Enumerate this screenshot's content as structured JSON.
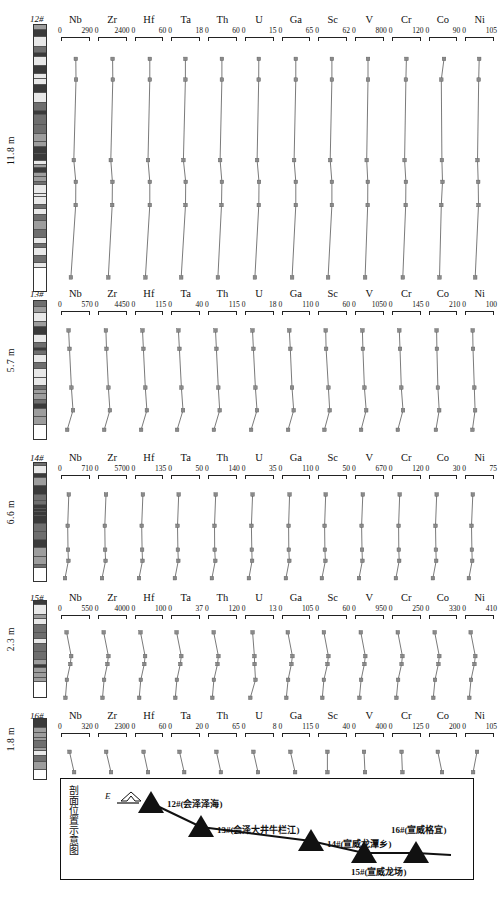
{
  "figure": {
    "elements": [
      "Nb",
      "Zr",
      "Hf",
      "Ta",
      "Th",
      "U",
      "Ga",
      "Sc",
      "V",
      "Cr",
      "Co",
      "Ni"
    ],
    "marker_color": "#8a8a8a",
    "line_color": "#6b6b6b"
  },
  "chart_data": {
    "type": "line",
    "xlabel": "Element concentration (ppm)",
    "ylabel": "Stratigraphic thickness (m)",
    "grid": false,
    "legend": "none",
    "orientation": "vertical-depth",
    "elements": [
      "Nb",
      "Zr",
      "Hf",
      "Ta",
      "Th",
      "U",
      "Ga",
      "Sc",
      "V",
      "Cr",
      "Co",
      "Ni"
    ],
    "panels": [
      {
        "section_id": "12",
        "section_label": "12#",
        "thickness_m": "11.8 m",
        "n_samples": 7,
        "depth_fraction": [
          0.03,
          0.12,
          0.47,
          0.565,
          0.665,
          0.98
        ],
        "axis_ranges": {
          "Nb": [
            0,
            290
          ],
          "Zr": [
            0,
            2400
          ],
          "Hf": [
            0,
            60
          ],
          "Ta": [
            0,
            18
          ],
          "Th": [
            0,
            60
          ],
          "U": [
            0,
            15
          ],
          "Ga": [
            0,
            65
          ],
          "Sc": [
            0,
            62
          ],
          "V": [
            0,
            800
          ],
          "Cr": [
            0,
            120
          ],
          "Co": [
            0,
            90
          ],
          "Ni": [
            0,
            105
          ]
        },
        "series": [
          {
            "name": "Nb",
            "values": [
              150,
              152,
              128,
              150,
              148,
              96
            ]
          },
          {
            "name": "Zr",
            "values": [
              1220,
              1240,
              1060,
              1200,
              1180,
              830
            ]
          },
          {
            "name": "Hf",
            "values": [
              31,
              31,
              27,
              31,
              31,
              21
            ]
          },
          {
            "name": "Ta",
            "values": [
              9.0,
              9.0,
              7.7,
              9.2,
              9.1,
              6.2
            ]
          },
          {
            "name": "Th",
            "values": [
              29,
              29,
              25,
              29,
              28,
              20
            ]
          },
          {
            "name": "U",
            "values": [
              7.2,
              7.1,
              6.2,
              7.3,
              7.2,
              5.0
            ]
          },
          {
            "name": "Ga",
            "values": [
              31,
              31,
              27,
              31,
              31,
              22
            ]
          },
          {
            "name": "Sc",
            "values": [
              30,
              30,
              26,
              30,
              30,
              21
            ]
          },
          {
            "name": "V",
            "values": [
              360,
              358,
              320,
              352,
              350,
              272
            ]
          },
          {
            "name": "Cr",
            "values": [
              60,
              58,
              52,
              58,
              57,
              44
            ]
          },
          {
            "name": "Co",
            "values": [
              47,
              38,
              40,
              42,
              38,
              32
            ]
          },
          {
            "name": "Ni",
            "values": [
              52,
              50,
              45,
              48,
              49,
              36
            ]
          }
        ]
      },
      {
        "section_id": "13",
        "section_label": "13#",
        "thickness_m": "5.7 m",
        "n_samples": 5,
        "depth_fraction": [
          0.05,
          0.22,
          0.58,
          0.79,
          0.97
        ],
        "axis_ranges": {
          "Nb": [
            0,
            570
          ],
          "Zr": [
            0,
            4450
          ],
          "Hf": [
            0,
            115
          ],
          "Ta": [
            0,
            40
          ],
          "Th": [
            0,
            115
          ],
          "U": [
            0,
            18
          ],
          "Ga": [
            0,
            110
          ],
          "Sc": [
            0,
            60
          ],
          "V": [
            0,
            1050
          ],
          "Cr": [
            0,
            145
          ],
          "Co": [
            0,
            210
          ],
          "Ni": [
            0,
            100
          ]
        },
        "series": [
          {
            "name": "Nb",
            "values": [
              140,
              160,
              200,
              235,
              110
            ]
          },
          {
            "name": "Zr",
            "values": [
              1150,
              1250,
              1560,
              1820,
              860
            ]
          },
          {
            "name": "Hf",
            "values": [
              28,
              32,
              40,
              47,
              22
            ]
          },
          {
            "name": "Ta",
            "values": [
              9.5,
              11,
              14,
              16.5,
              7.6
            ]
          },
          {
            "name": "Th",
            "values": [
              28,
              32,
              40,
              46,
              21
            ]
          },
          {
            "name": "U",
            "values": [
              4.4,
              5.0,
              6.3,
              7.4,
              3.4
            ]
          },
          {
            "name": "Ga",
            "values": [
              26,
              30,
              37,
              44,
              21
            ]
          },
          {
            "name": "Sc",
            "values": [
              15,
              16,
              21,
              24,
              12
            ]
          },
          {
            "name": "V",
            "values": [
              250,
              270,
              330,
              400,
              200
            ]
          },
          {
            "name": "Cr",
            "values": [
              34,
              38,
              45,
              54,
              26
            ]
          },
          {
            "name": "Co",
            "values": [
              52,
              54,
              62,
              72,
              46
            ]
          },
          {
            "name": "Ni",
            "values": [
              25,
              26,
              31,
              34,
              24
            ]
          }
        ]
      },
      {
        "section_id": "14",
        "section_label": "14#",
        "thickness_m": "6.6 m",
        "n_samples": 5,
        "depth_fraction": [
          0.06,
          0.4,
          0.66,
          0.78,
          0.97
        ],
        "axis_ranges": {
          "Nb": [
            0,
            710
          ],
          "Zr": [
            0,
            5700
          ],
          "Hf": [
            0,
            135
          ],
          "Ta": [
            0,
            50
          ],
          "Th": [
            0,
            140
          ],
          "U": [
            0,
            35
          ],
          "Ga": [
            0,
            110
          ],
          "Sc": [
            0,
            50
          ],
          "V": [
            0,
            670
          ],
          "Cr": [
            0,
            120
          ],
          "Co": [
            0,
            30
          ],
          "Ni": [
            0,
            75
          ]
        },
        "series": [
          {
            "name": "Nb",
            "values": [
              180,
              150,
              160,
              170,
              80
            ]
          },
          {
            "name": "Zr",
            "values": [
              1500,
              1230,
              1300,
              1400,
              640
            ]
          },
          {
            "name": "Hf",
            "values": [
              35,
              29,
              31,
              33,
              15
            ]
          },
          {
            "name": "Ta",
            "values": [
              12.5,
              10.2,
              11,
              11.7,
              5.4
            ]
          },
          {
            "name": "Th",
            "values": [
              35,
              29,
              30,
              33,
              15
            ]
          },
          {
            "name": "U",
            "values": [
              8.6,
              7.1,
              7.6,
              8.0,
              3.8
            ]
          },
          {
            "name": "Ga",
            "values": [
              27,
              23,
              24,
              26,
              12
            ]
          },
          {
            "name": "Sc",
            "values": [
              12.5,
              10.5,
              11,
              12,
              5.5
            ]
          },
          {
            "name": "V",
            "values": [
              170,
              140,
              150,
              160,
              75
            ]
          },
          {
            "name": "Cr",
            "values": [
              30,
              25,
              26,
              28,
              13
            ]
          },
          {
            "name": "Co",
            "values": [
              7.5,
              6.2,
              6.6,
              7.0,
              3.3
            ]
          },
          {
            "name": "Ni",
            "values": [
              19,
              15.5,
              16.5,
              17.5,
              8.2
            ]
          }
        ]
      },
      {
        "section_id": "15",
        "section_label": "15#",
        "thickness_m": "2.3 m",
        "n_samples": 5,
        "depth_fraction": [
          0.06,
          0.39,
          0.5,
          0.72,
          0.97
        ],
        "axis_ranges": {
          "Nb": [
            0,
            550
          ],
          "Zr": [
            0,
            4000
          ],
          "Hf": [
            0,
            100
          ],
          "Ta": [
            0,
            37
          ],
          "Th": [
            0,
            120
          ],
          "U": [
            0,
            13
          ],
          "Ga": [
            0,
            105
          ],
          "Sc": [
            0,
            60
          ],
          "V": [
            0,
            950
          ],
          "Cr": [
            0,
            250
          ],
          "Co": [
            0,
            330
          ],
          "Ni": [
            0,
            410
          ]
        },
        "series": [
          {
            "name": "Nb",
            "values": [
              95,
              190,
              170,
              100,
              70
            ]
          },
          {
            "name": "Zr",
            "values": [
              700,
              1400,
              1250,
              760,
              520
            ]
          },
          {
            "name": "Hf",
            "values": [
              17,
              34,
              31,
              18,
              12
            ]
          },
          {
            "name": "Ta",
            "values": [
              6.4,
              12.8,
              11.5,
              6.8,
              4.6
            ]
          },
          {
            "name": "Th",
            "values": [
              21,
              42,
              38,
              22,
              15
            ]
          },
          {
            "name": "U",
            "values": [
              3.2,
              4.1,
              4.2,
              4.6,
              2.1
            ]
          },
          {
            "name": "Ga",
            "values": [
              19,
              37,
              33,
              20,
              13
            ]
          },
          {
            "name": "Sc",
            "values": [
              11,
              21,
              19,
              11,
              7.5
            ]
          },
          {
            "name": "V",
            "values": [
              170,
              330,
              300,
              180,
              120
            ]
          },
          {
            "name": "Cr",
            "values": [
              45,
              88,
              80,
              48,
              32
            ]
          },
          {
            "name": "Co",
            "values": [
              58,
              115,
              104,
              62,
              41
            ]
          },
          {
            "name": "Ni",
            "values": [
              72,
              143,
              129,
              77,
              51
            ]
          }
        ]
      },
      {
        "section_id": "16",
        "section_label": "16#",
        "thickness_m": "1.8 m",
        "n_samples": 2,
        "depth_fraction": [
          0.18,
          0.82
        ],
        "axis_ranges": {
          "Nb": [
            0,
            320
          ],
          "Zr": [
            0,
            2300
          ],
          "Hf": [
            0,
            60
          ],
          "Ta": [
            0,
            20
          ],
          "Th": [
            0,
            65
          ],
          "U": [
            0,
            8
          ],
          "Ga": [
            0,
            115
          ],
          "Sc": [
            0,
            40
          ],
          "V": [
            0,
            400
          ],
          "Cr": [
            0,
            125
          ],
          "Co": [
            0,
            200
          ],
          "Ni": [
            0,
            105
          ]
        },
        "series": [
          {
            "name": "Nb",
            "values": [
              90,
              145
            ]
          },
          {
            "name": "Zr",
            "values": [
              620,
              1030
            ]
          },
          {
            "name": "Hf",
            "values": [
              17,
              27
            ]
          },
          {
            "name": "Ta",
            "values": [
              5.6,
              9.1
            ]
          },
          {
            "name": "Th",
            "values": [
              18,
              29
            ]
          },
          {
            "name": "U",
            "values": [
              2.2,
              3.6
            ]
          },
          {
            "name": "Ga",
            "values": [
              32,
              52
            ]
          },
          {
            "name": "Sc",
            "values": [
              12.5,
              12.5
            ]
          },
          {
            "name": "V",
            "values": [
              120,
              135
            ]
          },
          {
            "name": "Cr",
            "values": [
              40,
              44
            ]
          },
          {
            "name": "Co",
            "values": [
              58,
              90
            ]
          },
          {
            "name": "Ni",
            "values": [
              43,
              28
            ]
          }
        ]
      }
    ]
  },
  "inset": {
    "title": "剖面位置示意图",
    "orientation_label": "E",
    "sites": [
      {
        "id": "12",
        "label": "12#(会泽泽海)"
      },
      {
        "id": "13",
        "label": "13#(会泽大井牛栏江)"
      },
      {
        "id": "14",
        "label": "14#(宣威龙潭乡)"
      },
      {
        "id": "15",
        "label": "15#(宣威龙场)"
      },
      {
        "id": "16",
        "label": "16#(宣威格宜)"
      }
    ]
  }
}
